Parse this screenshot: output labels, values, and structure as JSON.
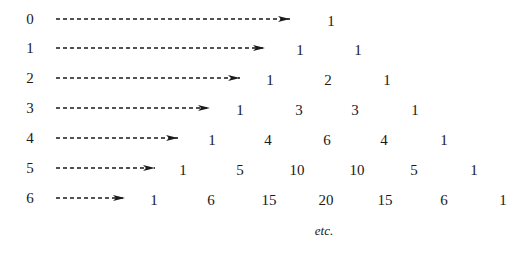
{
  "diagram": {
    "footer": "etc.",
    "colors": {
      "ink": "#1a1a1a",
      "background": "#ffffff"
    },
    "rows": [
      {
        "label": "0",
        "y": 19,
        "arrow_x1": 56,
        "arrow_x2": 290,
        "values": [
          "1"
        ],
        "xs": [
          331
        ]
      },
      {
        "label": "1",
        "y": 48,
        "arrow_x1": 56,
        "arrow_x2": 265,
        "values": [
          "1",
          "1"
        ],
        "xs": [
          300,
          358
        ]
      },
      {
        "label": "2",
        "y": 78,
        "arrow_x1": 56,
        "arrow_x2": 240,
        "values": [
          "1",
          "2",
          "1"
        ],
        "xs": [
          270,
          328,
          387
        ]
      },
      {
        "label": "3",
        "y": 108,
        "arrow_x1": 56,
        "arrow_x2": 210,
        "values": [
          "1",
          "3",
          "3",
          "1"
        ],
        "xs": [
          240,
          299,
          355,
          415
        ]
      },
      {
        "label": "4",
        "y": 138,
        "arrow_x1": 56,
        "arrow_x2": 178,
        "values": [
          "1",
          "4",
          "6",
          "4",
          "1"
        ],
        "xs": [
          212,
          268,
          327,
          384,
          444
        ]
      },
      {
        "label": "5",
        "y": 168,
        "arrow_x1": 56,
        "arrow_x2": 155,
        "values": [
          "1",
          "5",
          "10",
          "10",
          "5",
          "1"
        ],
        "xs": [
          183,
          240,
          297,
          357,
          414,
          474
        ]
      },
      {
        "label": "6",
        "y": 198,
        "arrow_x1": 56,
        "arrow_x2": 125,
        "values": [
          "1",
          "6",
          "15",
          "20",
          "15",
          "6",
          "1"
        ],
        "xs": [
          154,
          211,
          269,
          326,
          385,
          444,
          503
        ]
      }
    ],
    "label_x": 30,
    "etc_position": {
      "x": 324,
      "y": 231
    }
  }
}
